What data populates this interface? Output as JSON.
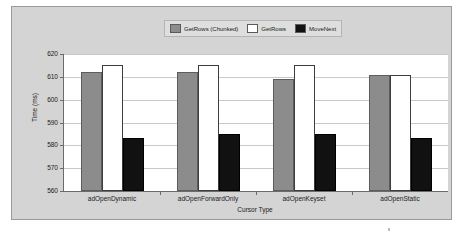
{
  "chart_data": {
    "type": "bar",
    "title": "",
    "xlabel": "Cursor Type",
    "ylabel": "Time (ms)",
    "ylim": [
      560,
      620
    ],
    "ytick_labels": [
      "620",
      "610",
      "600",
      "590",
      "580",
      "570",
      "560"
    ],
    "ytick_values": [
      620,
      610,
      600,
      590,
      580,
      570,
      560
    ],
    "grid": true,
    "legend_position": "top-center",
    "categories": [
      "adOpenDynamic",
      "adOpenForwardOnly",
      "adOpenKeyset",
      "adOpenStatic"
    ],
    "series": [
      {
        "name": "GetRows (Chunked)",
        "color": "#8c8c8c",
        "values": [
          612,
          612,
          609,
          611
        ]
      },
      {
        "name": "GetRows",
        "color": "#ffffff",
        "values": [
          615,
          615,
          615,
          611
        ]
      },
      {
        "name": "MoveNext",
        "color": "#111111",
        "values": [
          583,
          585,
          585,
          583
        ]
      }
    ]
  },
  "legend": {
    "entries": [
      {
        "label": "GetRows (Chunked)"
      },
      {
        "label": "GetRows"
      },
      {
        "label": "MoveNext"
      }
    ]
  },
  "axes": {
    "y_title": "Time (ms)",
    "x_title": "Cursor Type"
  },
  "colors": {
    "frame_background": "#d4d4d4",
    "plot_background": "#ffffff",
    "axis_line": "#6b6b6b",
    "gridline": "#c9c9c9",
    "series_chunked": "#8c8c8c",
    "series_getrows": "#ffffff",
    "series_movenext": "#111111"
  }
}
